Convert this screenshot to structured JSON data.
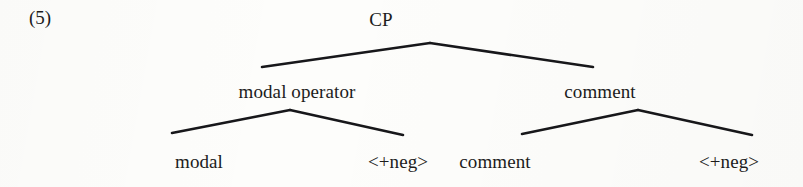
{
  "figure": {
    "example_number": "(5)",
    "type": "syntax-tree",
    "ink_color": "#17171a",
    "background_color": "#fdfdfb"
  },
  "tree": {
    "root": {
      "label": "CP",
      "label_x": 381,
      "label_y": 10,
      "apex_x": 430,
      "apex_y": 43
    },
    "level2": [
      {
        "label": "modal operator",
        "label_x": 297,
        "label_y": 82,
        "apex_x": 290,
        "apex_y": 110,
        "attach_x": 262,
        "attach_y": 67
      },
      {
        "label": "comment",
        "label_x": 600,
        "label_y": 82,
        "apex_x": 638,
        "apex_y": 110,
        "attach_x": 593,
        "attach_y": 67
      }
    ],
    "leaves": [
      {
        "label": "modal",
        "label_x": 199,
        "label_y": 152,
        "attach_x": 172,
        "attach_y": 133
      },
      {
        "label": "<+neg>",
        "label_x": 398,
        "label_y": 152,
        "attach_x": 403,
        "attach_y": 135
      },
      {
        "label": "comment",
        "label_x": 495,
        "label_y": 152,
        "attach_x": 522,
        "attach_y": 134
      },
      {
        "label": "<+neg>",
        "label_x": 729,
        "label_y": 152,
        "attach_x": 752,
        "attach_y": 135
      }
    ]
  }
}
